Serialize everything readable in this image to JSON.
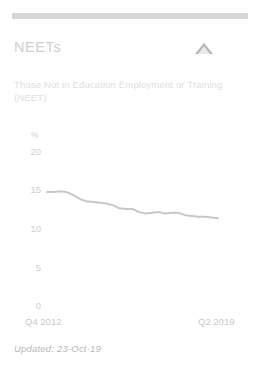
{
  "card": {
    "title": "NEETs",
    "subtitle": "Those Not in Education Employment or Training (NEET)",
    "trend_icon": "triangle-up-icon",
    "updated": "Updated: 23-Oct-19",
    "accent_color": "#d6d6d6",
    "line_color": "#c8c8c8",
    "text_color": "#cfcfcf"
  },
  "chart_data": {
    "type": "line",
    "title": "NEETs",
    "xlabel": "",
    "ylabel": "%",
    "ylim": [
      0,
      20
    ],
    "yticks": [
      0,
      5,
      10,
      15,
      20
    ],
    "xtick_labels": [
      "Q4 2012",
      "Q2 2019"
    ],
    "grid": false,
    "legend": "none",
    "x": [
      "Q4 2012",
      "Q1 2013",
      "Q2 2013",
      "Q3 2013",
      "Q4 2013",
      "Q1 2014",
      "Q2 2014",
      "Q3 2014",
      "Q4 2014",
      "Q1 2015",
      "Q2 2015",
      "Q3 2015",
      "Q4 2015",
      "Q1 2016",
      "Q2 2016",
      "Q3 2016",
      "Q4 2016",
      "Q1 2017",
      "Q2 2017",
      "Q3 2017",
      "Q4 2017",
      "Q1 2018",
      "Q2 2018",
      "Q3 2018",
      "Q4 2018",
      "Q1 2019",
      "Q2 2019"
    ],
    "series": [
      {
        "name": "NEET rate",
        "values": [
          14.8,
          14.8,
          14.9,
          14.8,
          14.4,
          13.9,
          13.6,
          13.5,
          13.4,
          13.3,
          13.1,
          12.7,
          12.6,
          12.6,
          12.2,
          12.0,
          12.1,
          12.2,
          12.0,
          12.1,
          12.1,
          11.8,
          11.7,
          11.6,
          11.6,
          11.5,
          11.4
        ]
      }
    ]
  }
}
